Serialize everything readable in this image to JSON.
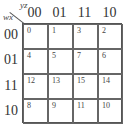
{
  "kmap": {
    "col_var": "yz",
    "row_var": "wx",
    "columns": [
      "00",
      "01",
      "11",
      "10"
    ],
    "rows": [
      "00",
      "01",
      "11",
      "10"
    ],
    "cells": [
      [
        "0",
        "1",
        "3",
        "2"
      ],
      [
        "4",
        "5",
        "7",
        "6"
      ],
      [
        "12",
        "13",
        "15",
        "14"
      ],
      [
        "8",
        "9",
        "11",
        "10"
      ]
    ]
  }
}
